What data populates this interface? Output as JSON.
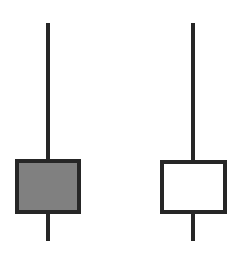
{
  "diagram": {
    "type": "candlestick-comparison",
    "colors": {
      "outline": "#262626",
      "bearish_fill": "#808080",
      "bullish_fill": "#ffffff",
      "background": "#ffffff"
    },
    "candles": [
      {
        "name": "bearish-candle",
        "fill": "filled",
        "wick_x": 48,
        "upper_wick": {
          "top": 23,
          "bottom": 161
        },
        "body": {
          "left": 15,
          "top": 159,
          "width": 66,
          "height": 55
        },
        "lower_wick": {
          "top": 213,
          "bottom": 241
        }
      },
      {
        "name": "bullish-candle",
        "fill": "hollow",
        "wick_x": 193,
        "upper_wick": {
          "top": 23,
          "bottom": 162
        },
        "body": {
          "left": 160,
          "top": 160,
          "width": 67,
          "height": 54
        },
        "lower_wick": {
          "top": 213,
          "bottom": 241
        }
      }
    ]
  }
}
